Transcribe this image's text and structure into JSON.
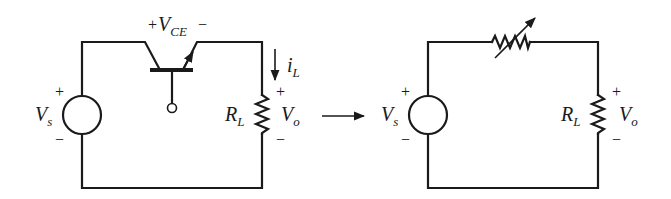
{
  "figure": {
    "left_circuit": {
      "source": {
        "label_main": "V",
        "label_sub": "s",
        "plus": "+",
        "minus": "−"
      },
      "transistor": {
        "label_main": "V",
        "label_sub": "CE",
        "plus": "+",
        "minus": "−"
      },
      "current": {
        "label_main": "i",
        "label_sub": "L"
      },
      "load": {
        "label_main": "R",
        "label_sub": "L"
      },
      "output": {
        "label_main": "V",
        "label_sub": "o",
        "plus": "+",
        "minus": "−"
      }
    },
    "equivalence_arrow": "→",
    "right_circuit": {
      "source": {
        "label_main": "V",
        "label_sub": "s",
        "plus": "+",
        "minus": "−"
      },
      "variable_resistor": {
        "label": ""
      },
      "load": {
        "label_main": "R",
        "label_sub": "L"
      },
      "output": {
        "label_main": "V",
        "label_sub": "o",
        "plus": "+",
        "minus": "−"
      }
    },
    "colors": {
      "ink": "#1a1a1a",
      "background": "#ffffff"
    }
  }
}
